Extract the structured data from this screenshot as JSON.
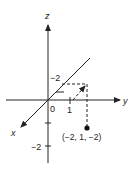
{
  "diagram": {
    "title": "",
    "axes": {
      "z_label": "z",
      "y_label": "y",
      "x_label": "x",
      "origin_label": "0"
    },
    "ticks": {
      "y_one": "1",
      "x_minus_two": "−2",
      "z_minus_two": "−2"
    },
    "point": {
      "label": "(−2, 1, −2)",
      "coords": [
        -2,
        1,
        -2
      ]
    },
    "colors": {
      "line": "#222222",
      "background": "#ffffff"
    }
  }
}
